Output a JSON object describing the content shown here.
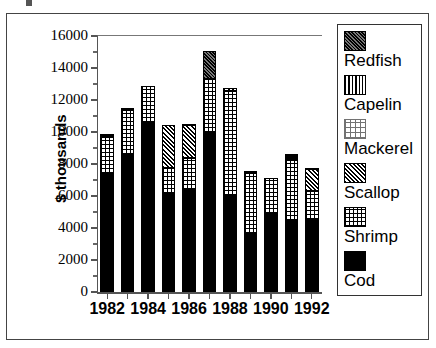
{
  "chart_data": {
    "type": "bar",
    "subtype": "stacked",
    "title": "",
    "xlabel": "",
    "ylabel": "$ thousands",
    "ylim": [
      0,
      16000
    ],
    "ytick_step": 2000,
    "yminor_step": 1000,
    "grid": false,
    "legend_position": "right",
    "ytick_labels": [
      "0",
      "2000",
      "4000",
      "6000",
      "8000",
      "10000",
      "12000",
      "14000",
      "16000"
    ],
    "ytick_values": [
      0,
      2000,
      4000,
      6000,
      8000,
      10000,
      12000,
      14000,
      16000
    ],
    "categories": [
      1982,
      1983,
      1984,
      1985,
      1986,
      1987,
      1988,
      1989,
      1990,
      1991,
      1992
    ],
    "xtick_labels": [
      "1982",
      "1984",
      "1986",
      "1988",
      "1990",
      "1992"
    ],
    "xtick_values": [
      1982,
      1984,
      1986,
      1988,
      1990,
      1992
    ],
    "series": [
      {
        "name": "Cod",
        "pattern": "solid-black",
        "values": [
          7350,
          8550,
          10550,
          6100,
          6350,
          9950,
          6000,
          3600,
          4850,
          4450,
          4500
        ]
      },
      {
        "name": "Shrimp",
        "pattern": "fine-grid",
        "values": [
          2350,
          2850,
          2350,
          1650,
          2000,
          3350,
          6550,
          3850,
          2300,
          3800,
          1800
        ]
      },
      {
        "name": "Scallop",
        "pattern": "diagonal-hatch",
        "values": [
          0,
          0,
          0,
          2700,
          2100,
          0,
          200,
          0,
          0,
          100,
          1400
        ]
      },
      {
        "name": "Mackerel",
        "pattern": "light-dots",
        "values": [
          0,
          0,
          0,
          0,
          0,
          0,
          0,
          0,
          0,
          100,
          0
        ]
      },
      {
        "name": "Capelin",
        "pattern": "vertical-lines",
        "values": [
          70,
          60,
          0,
          0,
          50,
          0,
          0,
          70,
          0,
          50,
          0
        ]
      },
      {
        "name": "Redfish",
        "pattern": "dense-crosshatch",
        "values": [
          130,
          40,
          0,
          0,
          0,
          1750,
          0,
          30,
          0,
          100,
          50
        ]
      }
    ],
    "totals": [
      9900,
      11500,
      12900,
      10450,
      10500,
      15050,
      12750,
      7550,
      7150,
      8500,
      7750
    ]
  },
  "legend": {
    "items": [
      {
        "label": "Redfish",
        "pattern": "dense-crosshatch"
      },
      {
        "label": "Capelin",
        "pattern": "vertical-lines"
      },
      {
        "label": "Mackerel",
        "pattern": "light-dots"
      },
      {
        "label": "Scallop",
        "pattern": "diagonal-hatch"
      },
      {
        "label": "Shrimp",
        "pattern": "fine-grid"
      },
      {
        "label": "Cod",
        "pattern": "solid-black"
      }
    ]
  },
  "axis": {
    "y_title": "$ thousands"
  },
  "colors": {
    "foreground": "#000000",
    "background": "#ffffff",
    "axis": "#555555",
    "frame": "#444444"
  }
}
